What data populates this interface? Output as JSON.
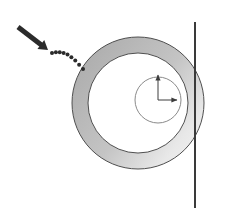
{
  "canvas": {
    "width": 250,
    "height": 208,
    "background": "#ffffff"
  },
  "figure": {
    "kind": "annulus-with-axis-diagram",
    "title_text": "",
    "labels": []
  },
  "colors": {
    "ring_fill_dark": "#a8a8a8",
    "ring_fill_mid": "#bdbdbd",
    "ring_fill_light": "#f2f2f2",
    "ring_stroke": "#4f4f4f",
    "inner_disc_fill": "#ffffff",
    "inner_circle_stroke": "#8a8a8a",
    "axis_line": "#3a3a3a",
    "callout_arrow": "#2b2b2b",
    "leader_dots": "#2b2b2b"
  },
  "shapes": {
    "annulus": {
      "name": "annulus",
      "center_x": 138,
      "center_y": 103,
      "outer_radius": 66,
      "inner_radius": 50,
      "stroke_width": 1
    },
    "inner_circle": {
      "name": "inner-circle",
      "center_x": 158,
      "center_y": 100,
      "radius": 23,
      "stroke_width": 1
    },
    "axis_line": {
      "name": "vertical-axis-line",
      "x": 195,
      "y_start": 22,
      "y_end": 208,
      "stroke_width": 2
    },
    "callout_arrow": {
      "name": "callout-arrow",
      "x1": 18,
      "y1": 27,
      "x2": 48,
      "y2": 50,
      "stroke_width": 5,
      "head_size": 9
    },
    "leader_dots": {
      "name": "dotted-leader",
      "start_x": 52,
      "start_y": 53,
      "end_x": 83,
      "end_y": 69,
      "dot_radius": 2,
      "dot_count": 9
    },
    "clock_hand_up": {
      "name": "clock-hand-up",
      "from_x": 158,
      "from_y": 100,
      "to_x": 158,
      "to_y": 75,
      "stroke_width": 1
    },
    "clock_hand_right": {
      "name": "clock-hand-right",
      "from_x": 158,
      "from_y": 100,
      "to_x": 177,
      "to_y": 100,
      "stroke_width": 1
    }
  }
}
